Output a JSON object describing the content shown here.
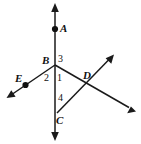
{
  "figure": {
    "background_color": "#ffffff",
    "stroke_color": "#1a1a1a",
    "width": 141,
    "height": 144,
    "points": [
      {
        "id": "A",
        "label": "A",
        "x": 55,
        "y": 29,
        "has_dot": true
      },
      {
        "id": "B",
        "label": "B",
        "x": 55,
        "y": 65,
        "has_dot": false
      },
      {
        "id": "C",
        "label": "C",
        "x": 57,
        "y": 113,
        "has_dot": false
      },
      {
        "id": "D",
        "label": "D",
        "x": 83,
        "y": 78,
        "has_dot": false
      },
      {
        "id": "E",
        "label": "E",
        "x": 25,
        "y": 85,
        "has_dot": true
      }
    ],
    "angles": [
      {
        "id": "1",
        "label": "1"
      },
      {
        "id": "2",
        "label": "2"
      },
      {
        "id": "3",
        "label": "3"
      },
      {
        "id": "4",
        "label": "4"
      }
    ],
    "lines": [
      {
        "id": "vertical-line",
        "description": "line through A, B and C with arrowheads at both ends",
        "x1": 55,
        "y1": 8,
        "x2": 55,
        "y2": 136,
        "arrow_start": true,
        "arrow_end": true
      },
      {
        "id": "ray-B-through-E",
        "description": "ray from B down-left through E with arrowhead",
        "x1": 55,
        "y1": 65,
        "x2": 11,
        "y2": 95,
        "arrow_start": false,
        "arrow_end": true
      },
      {
        "id": "ray-B-through-D",
        "description": "ray from B down-right through D with arrowhead",
        "x1": 55,
        "y1": 65,
        "x2": 130,
        "y2": 108,
        "arrow_start": false,
        "arrow_end": true
      },
      {
        "id": "ray-C-through-D",
        "description": "ray from C up-right through D with arrowhead",
        "x1": 57,
        "y1": 113,
        "x2": 110,
        "y2": 58,
        "arrow_start": false,
        "arrow_end": true
      }
    ]
  }
}
